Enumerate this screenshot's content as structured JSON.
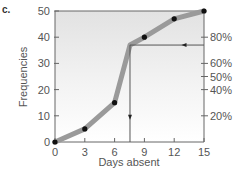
{
  "panel_label": "c.",
  "chart_data": {
    "type": "line",
    "title": "",
    "xlabel": "Days absent",
    "ylabel": "Frequencies",
    "xlim": [
      0,
      15
    ],
    "ylim": [
      0,
      50
    ],
    "x_ticks": [
      0,
      3,
      6,
      9,
      12,
      15
    ],
    "y_ticks": [
      0,
      10,
      20,
      30,
      40,
      50
    ],
    "series": [
      {
        "name": "Cumulative frequency (ogive)",
        "x": [
          0,
          3,
          6,
          7.55,
          9,
          12,
          15
        ],
        "y": [
          0,
          5,
          15,
          37,
          40,
          47,
          50
        ],
        "markers": [
          true,
          true,
          true,
          false,
          true,
          true,
          true
        ]
      }
    ],
    "secondary_axis": {
      "side": "right",
      "tick_labels": [
        "20%",
        "40%",
        "50%",
        "60%",
        "80%"
      ],
      "tick_values_freq": [
        10,
        20,
        25,
        30,
        40
      ]
    },
    "annotations": [
      {
        "type": "horizontal-arrow",
        "from_x": 15,
        "to_x": 7.55,
        "y": 37,
        "direction": "left",
        "label": "80th percentile reading"
      },
      {
        "type": "vertical-arrow",
        "x": 7.55,
        "from_y": 37,
        "to_y": 0,
        "direction": "down"
      }
    ],
    "grid": false,
    "background": "gradient gray-to-white (top to bottom)",
    "colors": {
      "line": "#9a9a9a",
      "marker": "#111111",
      "axis": "#666666",
      "annotation": "#555555"
    }
  }
}
